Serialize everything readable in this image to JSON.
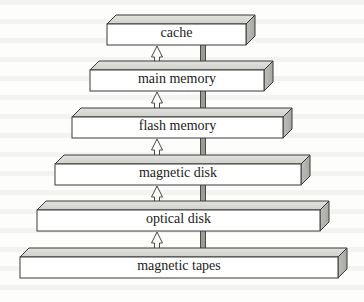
{
  "diagram": {
    "type": "pyramid-stack",
    "geometry": {
      "width": 364,
      "height": 302,
      "depth_dx": 9,
      "depth_dy": 9,
      "face_height": 21,
      "level_pitch": 46.5,
      "first_top_y": 15
    },
    "colors": {
      "top_face": "#cfcfcb",
      "top_face_hi": "#e2e2df",
      "front_face": "#ffffff",
      "side_face": "#a7a7a3",
      "outline": "#3a3a38",
      "down_arrow_fill": "#9b9b97",
      "down_arrow_stroke": "#4a4a48",
      "up_arrow_fill": "#fbfbfa",
      "up_arrow_stroke": "#4a4a48",
      "background": "#fdfdfc",
      "text": "#1b1b1b"
    },
    "arrows": {
      "up_x": 157,
      "down_x": 203,
      "up_name": "upward-hollow-arrow",
      "down_name": "downward-filled-arrow",
      "up_direction": "up",
      "down_direction": "down",
      "count": 5
    },
    "levels": [
      {
        "label": "cache",
        "left": 107,
        "right": 255,
        "top": 15,
        "font_size": 14
      },
      {
        "label": "main memory",
        "left": 90,
        "right": 273,
        "top": 61,
        "font_size": 14
      },
      {
        "label": "flash memory",
        "left": 72,
        "right": 292,
        "top": 108,
        "font_size": 14
      },
      {
        "label": "magnetic disk",
        "left": 55,
        "right": 310,
        "top": 155,
        "font_size": 14
      },
      {
        "label": "optical disk",
        "left": 37,
        "right": 329,
        "top": 201,
        "font_size": 14
      },
      {
        "label": "magnetic tapes",
        "left": 20,
        "right": 347,
        "top": 248,
        "font_size": 14
      }
    ]
  },
  "chart_data": {
    "type": "diagram",
    "categories": [
      "cache",
      "main memory",
      "flash memory",
      "magnetic disk",
      "optical disk",
      "magnetic tapes"
    ],
    "values": [
      148,
      183,
      220,
      255,
      292,
      327
    ],
    "ylabel": "hierarchy level",
    "xlabel": "relative capacity (slab width, px)"
  }
}
